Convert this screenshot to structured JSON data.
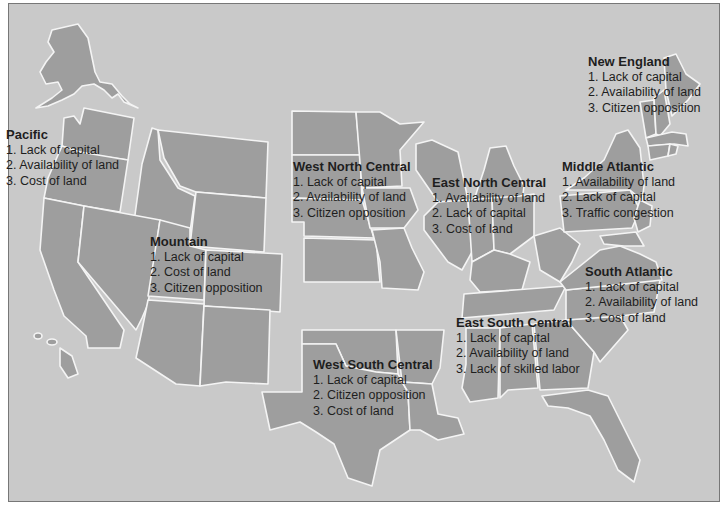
{
  "map": {
    "background_color": "#c9c9c9",
    "state_fill": "#9e9e9e",
    "border_color": "#f4f4f4",
    "regions": [
      {
        "id": "pacific",
        "name": "Pacific",
        "items": [
          "1. Lack of capital",
          "2. Availability of land",
          "3. Cost of land"
        ]
      },
      {
        "id": "mountain",
        "name": "Mountain",
        "items": [
          "1. Lack of capital",
          "2. Cost of land",
          "3. Citizen opposition"
        ]
      },
      {
        "id": "west-north-central",
        "name": "West North Central",
        "items": [
          "1. Lack of capital",
          "2. Availability of land",
          "3. Citizen opposition"
        ]
      },
      {
        "id": "east-north-central",
        "name": "East North Central",
        "items": [
          "1. Availability of land",
          "2. Lack of capital",
          "3. Cost of land"
        ]
      },
      {
        "id": "new-england",
        "name": "New England",
        "items": [
          "1. Lack of capital",
          "2. Availability of land",
          "3. Citizen opposition"
        ]
      },
      {
        "id": "middle-atlantic",
        "name": "Middle Atlantic",
        "items": [
          "1. Availability of land",
          "2. Lack of capital",
          "3. Traffic congestion"
        ]
      },
      {
        "id": "south-atlantic",
        "name": "South Atlantic",
        "items": [
          "1. Lack of capital",
          "2. Availability of land",
          "3. Cost of land"
        ]
      },
      {
        "id": "east-south-central",
        "name": "East South Central",
        "items": [
          "1. Lack of capital",
          "2. Availability of land",
          "3. Lack of skilled labor"
        ]
      },
      {
        "id": "west-south-central",
        "name": "West South Central",
        "items": [
          "1. Lack of capital",
          "2. Citizen opposition",
          "3. Cost of land"
        ]
      }
    ]
  }
}
